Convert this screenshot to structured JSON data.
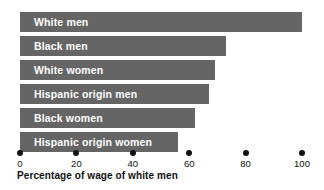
{
  "chart_data": {
    "type": "bar",
    "orientation": "horizontal",
    "title": "",
    "xlabel": "Percentage of wage of white men",
    "ylabel": "",
    "xlim": [
      0,
      100
    ],
    "grid": false,
    "legend": false,
    "bar_color": "#656565",
    "label_color": "#ffffff",
    "axis_color": "#111111",
    "categories": [
      "White men",
      "Black men",
      "White women",
      "Hispanic origin men",
      "Black women",
      "Hispanic origin women"
    ],
    "values": [
      100,
      73,
      69,
      67,
      62,
      56
    ],
    "xticks": [
      0,
      20,
      40,
      60,
      80,
      100
    ],
    "xtick_labels": [
      "0",
      "20",
      "40",
      "60",
      "80",
      "100"
    ]
  },
  "bars": [
    {
      "label": "White men",
      "value": 100
    },
    {
      "label": "Black men",
      "value": 73
    },
    {
      "label": "White women",
      "value": 69
    },
    {
      "label": "Hispanic origin men",
      "value": 67
    },
    {
      "label": "Black women",
      "value": 62
    },
    {
      "label": "Hispanic origin women",
      "value": 56
    }
  ],
  "axis": {
    "title": "Percentage of wage of white men",
    "ticks": [
      "0",
      "20",
      "40",
      "60",
      "80",
      "100"
    ]
  }
}
